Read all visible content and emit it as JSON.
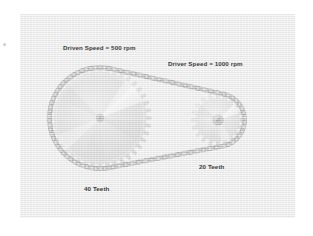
{
  "figure": {
    "background_color": "#ffffff",
    "panel_color": "#ececec"
  },
  "colors": {
    "chain": "#8f8f8f",
    "chain_dark": "#6e6e6e",
    "chain_light": "#d2d2d2",
    "sprocket_face": "#c9c9c9",
    "sprocket_light": "#e8e8e8",
    "sprocket_shadow": "#a6a6a6",
    "label_text": "#3a3a3a",
    "panel": "#ececec"
  },
  "labels": {
    "driven_speed": "Driven Speed = 500 rpm",
    "driver_speed": "Driver Speed = 1000 rpm",
    "large_sprocket_teeth": "40 Teeth",
    "small_sprocket_teeth": "20 Teeth"
  },
  "components": {
    "driven_sprocket": {
      "name": "driven-sprocket",
      "teeth": 40,
      "speed_rpm": 500,
      "role": "driven",
      "center": {
        "x": 100,
        "y": 118
      },
      "pitch_radius": 51,
      "hub_radius": 4
    },
    "driver_sprocket": {
      "name": "driver-sprocket",
      "teeth": 20,
      "speed_rpm": 1000,
      "role": "driver",
      "center": {
        "x": 218,
        "y": 120
      },
      "pitch_radius": 26,
      "hub_radius": 5
    },
    "chain": {
      "name": "roller-chain",
      "link_count": 96,
      "link_radius": 2.6
    }
  },
  "chart_data": {
    "type": "diagram",
    "annotations": [
      {
        "text": "Driven Speed = 500 rpm",
        "target": "driven-sprocket"
      },
      {
        "text": "Driver Speed = 1000 rpm",
        "target": "driver-sprocket"
      },
      {
        "text": "40 Teeth",
        "target": "driven-sprocket"
      },
      {
        "text": "20 Teeth",
        "target": "driver-sprocket"
      }
    ],
    "series": [
      {
        "name": "Driven sprocket",
        "teeth": 40,
        "speed_rpm": 500
      },
      {
        "name": "Driver sprocket",
        "teeth": 20,
        "speed_rpm": 1000
      }
    ]
  }
}
